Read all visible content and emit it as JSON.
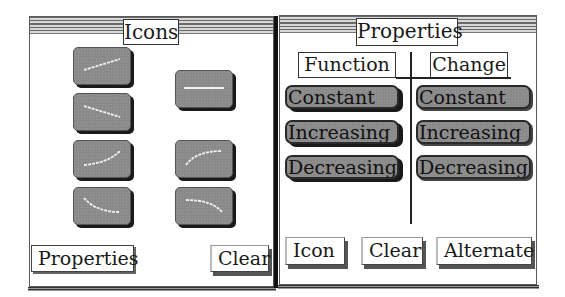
{
  "icons_window": {
    "title": "Icons",
    "tiles": [
      {
        "name": "linear-increasing",
        "path": "M10 22 L46 11"
      },
      {
        "name": "constant",
        "path": "M8 17 L48 17"
      },
      {
        "name": "linear-decreasing",
        "path": "M10 12 L46 23"
      },
      {
        "name": "increasing-concave-up",
        "path": "M10 24 Q34 22 46 10"
      },
      {
        "name": "increasing-concave-down",
        "path": "M10 24 Q20 10 46 10"
      },
      {
        "name": "decreasing-concave-up",
        "path": "M10 10 Q22 24 46 24"
      },
      {
        "name": "decreasing-concave-down",
        "path": "M10 12 Q36 12 46 24"
      }
    ],
    "buttons": {
      "properties": "Properties",
      "clear": "Clear"
    }
  },
  "properties_window": {
    "title": "Properties",
    "columns": {
      "function": {
        "header": "Function",
        "options": [
          "Constant",
          "Increasing",
          "Decreasing"
        ]
      },
      "change": {
        "header": "Change",
        "options": [
          "Constant",
          "Increasing",
          "Decreasing"
        ]
      }
    },
    "buttons": {
      "icon": "Icon",
      "clear": "Clear",
      "alternate": "Alternate"
    }
  },
  "colors": {
    "tile_fill": "#8a8a8a",
    "border": "#2a2a2a",
    "stripe_dark": "#6a6a6a",
    "stripe_light": "#d8d8d8"
  }
}
